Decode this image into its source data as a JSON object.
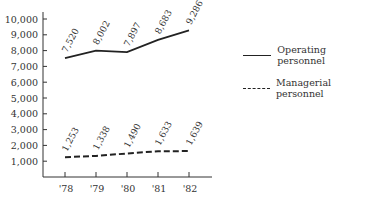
{
  "chart_data": {
    "type": "line",
    "title": "",
    "xlabel": "",
    "ylabel": "",
    "categories": [
      "'78",
      "'79",
      "'80",
      "'81",
      "'82"
    ],
    "series": [
      {
        "name": "Operating personnel",
        "style": "solid",
        "values": [
          7520,
          8002,
          7897,
          8683,
          9286
        ],
        "labels": [
          "7,520",
          "8,002",
          "7,897",
          "8,683",
          "9,286"
        ]
      },
      {
        "name": "Managerial personnel",
        "style": "dashed",
        "values": [
          1253,
          1338,
          1490,
          1633,
          1639
        ],
        "labels": [
          "1,253",
          "1,338",
          "1,490",
          "1,633",
          "1,639"
        ]
      }
    ],
    "yticks": [
      "1,000",
      "2,000",
      "3,000",
      "4,000",
      "5,000",
      "6,000",
      "7,000",
      "8,000",
      "9,000",
      "10,000"
    ],
    "ylim": [
      0,
      10000
    ],
    "grid": false,
    "legend_position": "right",
    "color": "#222222"
  },
  "legend": {
    "operating": "Operating personnel",
    "managerial": "Managerial personnel"
  }
}
